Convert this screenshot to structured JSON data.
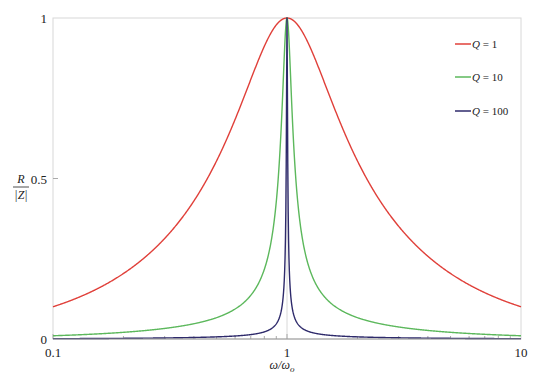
{
  "chart_data": {
    "type": "line",
    "title": "",
    "xlabel": "ω/ω_o",
    "ylabel": "R/|Z|",
    "xscale": "log",
    "xlim": [
      0.1,
      10
    ],
    "ylim": [
      0,
      1
    ],
    "grid": true,
    "legend_position": "upper right",
    "x_ticks": [
      {
        "value": 0.1,
        "label": "0.1"
      },
      {
        "value": 1,
        "label": "1"
      },
      {
        "value": 10,
        "label": "10"
      }
    ],
    "y_ticks": [
      {
        "value": 0,
        "label": "0"
      },
      {
        "value": 0.5,
        "label": "0.5"
      },
      {
        "value": 1,
        "label": "1"
      }
    ],
    "formula": "R/|Z| = 1 / sqrt(1 + Q^2 (x - 1/x)^2)",
    "x": [
      0.1,
      0.2,
      0.5,
      0.8,
      0.9,
      0.95,
      0.99,
      1,
      1.01,
      1.053,
      1.111,
      1.25,
      2,
      5,
      10
    ],
    "series": [
      {
        "name": "Q = 1",
        "Q": 1,
        "color": "#e0403a",
        "values": [
          0.1005,
          0.204,
          0.555,
          0.912,
          0.978,
          0.995,
          1.0,
          1.0,
          1.0,
          0.995,
          0.978,
          0.912,
          0.555,
          0.204,
          0.1005
        ]
      },
      {
        "name": "Q = 10",
        "Q": 10,
        "color": "#5cb85c",
        "values": [
          0.0101,
          0.0208,
          0.0665,
          0.217,
          0.428,
          0.698,
          0.98,
          1.0,
          0.98,
          0.698,
          0.428,
          0.217,
          0.0665,
          0.0208,
          0.0101
        ]
      },
      {
        "name": "Q = 100",
        "Q": 100,
        "color": "#2e2a6b",
        "values": [
          0.00101,
          0.00208,
          0.00667,
          0.0222,
          0.0473,
          0.097,
          0.445,
          1.0,
          0.445,
          0.097,
          0.0473,
          0.0222,
          0.00667,
          0.00208,
          0.00101
        ]
      }
    ]
  },
  "legend": {
    "items": [
      {
        "q_symbol": "Q",
        "text": " = 1"
      },
      {
        "q_symbol": "Q",
        "text": " = 10"
      },
      {
        "q_symbol": "Q",
        "text": " = 100"
      }
    ]
  },
  "axes": {
    "y_label_numerator": "R",
    "y_label_denominator": "|Z|",
    "x_label_main": "ω/ω",
    "x_label_sub": "o"
  }
}
